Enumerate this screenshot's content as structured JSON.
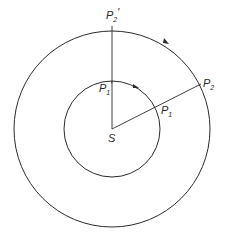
{
  "diagram": {
    "center_label": "S",
    "points": {
      "P1": {
        "base": "P",
        "sub": "1",
        "prime": ""
      },
      "P2": {
        "base": "P",
        "sub": "2",
        "prime": ""
      },
      "P1_prime": {
        "base": "P",
        "sub": "1",
        "prime": "′"
      },
      "P2_prime": {
        "base": "P",
        "sub": "2",
        "prime": "′"
      }
    },
    "stroke_color": "#2a2a2a",
    "background": "#ffffff"
  }
}
